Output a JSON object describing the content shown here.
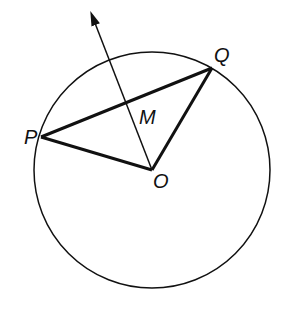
{
  "diagram": {
    "type": "geometry",
    "circle": {
      "center": "O",
      "cx": 152,
      "cy": 170,
      "r": 118
    },
    "points": {
      "P": {
        "x": 41,
        "y": 137,
        "label": "P"
      },
      "Q": {
        "x": 212,
        "y": 68,
        "label": "Q"
      },
      "O": {
        "x": 152,
        "y": 170,
        "label": "O"
      },
      "M": {
        "x": 126,
        "y": 102,
        "label": "M"
      }
    },
    "segments": [
      {
        "from": "P",
        "to": "Q",
        "weight": "thick"
      },
      {
        "from": "P",
        "to": "O",
        "weight": "thick"
      },
      {
        "from": "Q",
        "to": "O",
        "weight": "thick"
      }
    ],
    "ray": {
      "from": "O",
      "through": "M",
      "arrow": true,
      "tip": {
        "x": 91,
        "y": 12
      }
    },
    "colors": {
      "stroke": "#111111",
      "background": "#ffffff"
    }
  }
}
